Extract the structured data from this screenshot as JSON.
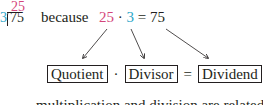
{
  "long_division": {
    "divisor": "3",
    "dividend": "75",
    "quotient": "25"
  },
  "because_label": "because",
  "check_equation": {
    "factor_a": "25",
    "dot": "·",
    "factor_b": "3",
    "equals": "=",
    "result": "75"
  },
  "term_equation": {
    "quotient_label": "Quotient",
    "dot": "·",
    "divisor_label": "Divisor",
    "equals": "=",
    "dividend_label": "Dividend"
  },
  "footer_text": "multiplication and division are related in th",
  "colors": {
    "quotient": "#d4457a",
    "divisor": "#2aa6c8",
    "text": "#231f20"
  }
}
